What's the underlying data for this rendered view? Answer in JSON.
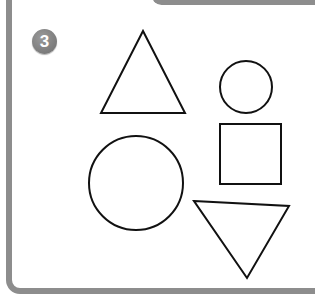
{
  "exercise": {
    "number": "3",
    "badge_color": "#7a7a7a",
    "border_color": "#8d8d8d",
    "stroke_color": "#111111"
  },
  "shapes": [
    {
      "type": "triangle",
      "orientation": "up",
      "label": "upward-triangle"
    },
    {
      "type": "circle",
      "size": "small",
      "label": "small-circle"
    },
    {
      "type": "square",
      "label": "square"
    },
    {
      "type": "circle",
      "size": "large",
      "label": "large-circle"
    },
    {
      "type": "triangle",
      "orientation": "down",
      "label": "downward-triangle"
    }
  ]
}
